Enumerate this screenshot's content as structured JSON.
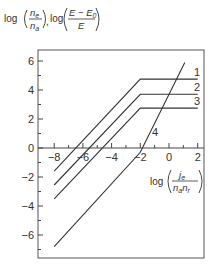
{
  "chart_data": {
    "type": "line",
    "title": "",
    "ylabel": "log(n_e/n_a), log((E − E_0)/E)",
    "xlabel": "log(j_e/(n_a n_r))",
    "ylabel_parts": {
      "log1": "log",
      "num1": "n",
      "num1_sub": "e",
      "den1": "n",
      "den1_sub": "a",
      "sep": ",",
      "log2": "log",
      "num2": "E − E",
      "num2_sub": "0",
      "den2": "E"
    },
    "xlabel_parts": {
      "log": "log",
      "num": "j",
      "num_sub": "e",
      "den": "n",
      "den_sub1": "a",
      "den2": "n",
      "den_sub2": "r"
    },
    "xlim": [
      -9,
      2.5
    ],
    "ylim": [
      -7.5,
      6.8
    ],
    "x_ticks": [
      -8,
      -6,
      -4,
      -2,
      0,
      2
    ],
    "x_tick_labels": [
      "−8",
      "−6",
      "−4",
      "−2",
      "0",
      "2"
    ],
    "y_ticks": [
      -6,
      -4,
      -2,
      0,
      2,
      4,
      6
    ],
    "y_tick_labels": [
      "−6",
      "−4",
      "−2",
      "0",
      "2",
      "4",
      "6"
    ],
    "grid": false,
    "legend": "inline labels at right",
    "series": [
      {
        "name": "1",
        "points": [
          [
            -8,
            -1.6
          ],
          [
            -2,
            4.75
          ],
          [
            2,
            4.75
          ]
        ]
      },
      {
        "name": "2",
        "points": [
          [
            -8,
            -2.55
          ],
          [
            -2,
            3.7
          ],
          [
            2,
            3.7
          ]
        ]
      },
      {
        "name": "3",
        "points": [
          [
            -8,
            -3.5
          ],
          [
            -2,
            2.75
          ],
          [
            2,
            2.75
          ]
        ]
      },
      {
        "name": "4",
        "points": [
          [
            -8,
            -6.8
          ],
          [
            -2,
            -0.3
          ],
          [
            1.1,
            5.9
          ]
        ]
      }
    ]
  }
}
